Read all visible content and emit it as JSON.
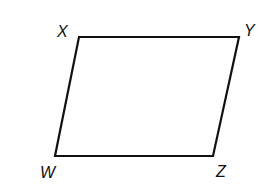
{
  "figure": {
    "shape": "parallelogram",
    "stroke_color": "#111111",
    "background": "#ffffff",
    "vertices": [
      {
        "label": "X",
        "x": 79,
        "y": 37
      },
      {
        "label": "Y",
        "x": 239,
        "y": 37
      },
      {
        "label": "Z",
        "x": 213,
        "y": 156
      },
      {
        "label": "W",
        "x": 55,
        "y": 156
      }
    ],
    "labels": {
      "x": "X",
      "y": "Y",
      "z": "Z",
      "w": "W"
    }
  }
}
